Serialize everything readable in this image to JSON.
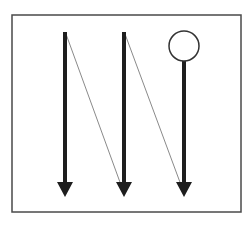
{
  "diagram": {
    "type": "scan-path",
    "colors": {
      "background": "#ffffff",
      "frame": "#4a4a4a",
      "arrow": "#1e1e1e",
      "connector": "#8a8a8a",
      "marker_stroke": "#333333"
    },
    "frame": {
      "x": 12,
      "y": 15,
      "width": 229,
      "height": 197
    },
    "columns": [
      {
        "id": "col-1",
        "x": 65,
        "y_start": 32,
        "y_end": 197,
        "start_marker": "none"
      },
      {
        "id": "col-2",
        "x": 124,
        "y_start": 32,
        "y_end": 197,
        "start_marker": "none"
      },
      {
        "id": "col-3",
        "x": 184,
        "y_start": 61,
        "y_end": 197,
        "start_marker": "circle"
      }
    ],
    "connectors": [
      {
        "from": "col-1-top",
        "x1": 66,
        "y1": 34,
        "x2": 121,
        "y2": 185
      },
      {
        "from": "col-2-top",
        "x1": 125,
        "y1": 34,
        "x2": 181,
        "y2": 185
      }
    ],
    "circle_marker": {
      "cx": 184,
      "cy": 46,
      "r": 15
    }
  }
}
